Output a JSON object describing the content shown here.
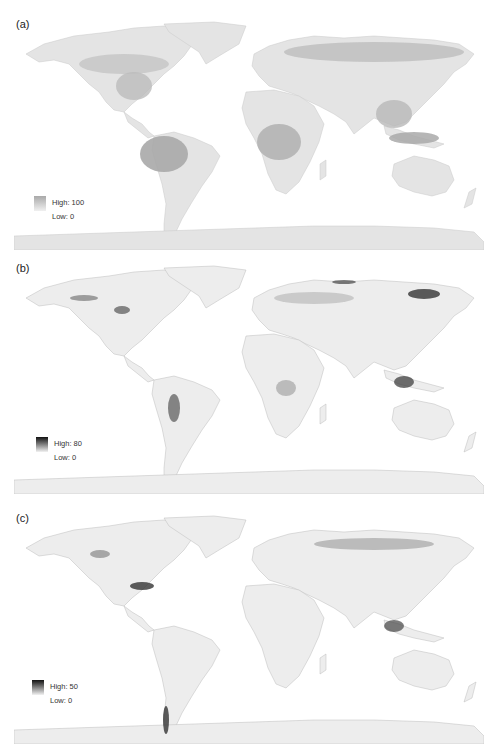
{
  "panels": [
    {
      "label": "(a)",
      "legend": {
        "high": "High: 100",
        "low": "Low: 0",
        "high_color": "#a9a9a9",
        "low_color": "#f0f0f0"
      },
      "description": "Global map, light-to-medium grey scale; darkest in Amazon, Congo basin, SE Asia, boreal forest belt"
    },
    {
      "label": "(b)",
      "legend": {
        "high": "High: 80",
        "low": "Low: 0",
        "high_color": "#111111",
        "low_color": "#f2f2f2"
      },
      "description": "Global map, near-white with dark hotspots in eastern Siberia, SE Asia islands, Andes, western North America"
    },
    {
      "label": "(c)",
      "legend": {
        "high": "High: 50",
        "low": "Low: 0",
        "high_color": "#111111",
        "low_color": "#f2f2f2"
      },
      "description": "Global map, near-white with dark hotspots in southeastern USA, southern Chile, SE Asia, Siberia"
    }
  ]
}
